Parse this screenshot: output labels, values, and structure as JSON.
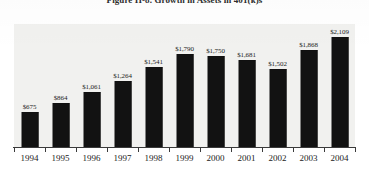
{
  "figure": {
    "title": "Figure II-8.   Growth in Assets in 401(k)s",
    "axis_line_name": "category-axis"
  },
  "chart_data": {
    "type": "bar",
    "title": "Figure II-8.   Growth in Assets in 401(k)s",
    "xlabel": "",
    "ylabel": "",
    "ylim": [
      0,
      2109
    ],
    "grid": false,
    "legend": "none",
    "categories": [
      "1994",
      "1995",
      "1996",
      "1997",
      "1998",
      "1999",
      "2000",
      "2001",
      "2002",
      "2003",
      "2004"
    ],
    "values": [
      675,
      864,
      1061,
      1264,
      1541,
      1790,
      1750,
      1681,
      1502,
      1868,
      2109
    ],
    "data_labels": [
      "$675",
      "$864",
      "$1,061",
      "$1,264",
      "$1,541",
      "$1,790",
      "$1,750",
      "$1,681",
      "$1,502",
      "$1,868",
      "$2,109"
    ],
    "bar_color": "#121212",
    "plot_background": "#f1f1ef"
  }
}
